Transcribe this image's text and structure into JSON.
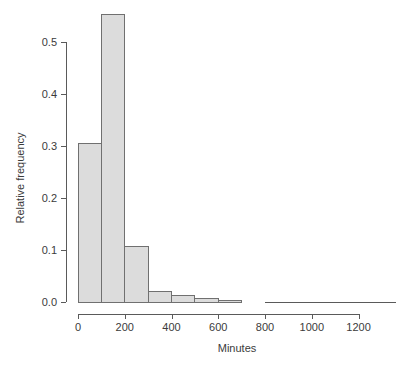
{
  "chart_data": {
    "type": "bar",
    "title": "",
    "subtitle": "",
    "xlabel": "Minutes",
    "ylabel": "Relative frequency",
    "xlim": [
      0,
      1300
    ],
    "ylim": [
      0.0,
      0.56
    ],
    "grid": false,
    "legend": "none",
    "bin_width": 100,
    "bin_edges": [
      0,
      100,
      200,
      300,
      400,
      500,
      600,
      700
    ],
    "categories": [
      "0-100",
      "100-200",
      "200-300",
      "300-400",
      "400-500",
      "500-600",
      "600-700"
    ],
    "values": [
      0.305,
      0.552,
      0.107,
      0.021,
      0.012,
      0.006,
      0.003
    ],
    "xticks": [
      0,
      200,
      400,
      600,
      800,
      1000,
      1200
    ],
    "xtick_labels": [
      "0",
      "200",
      "400",
      "600",
      "800",
      "1000",
      "1200"
    ],
    "yticks": [
      0.0,
      0.1,
      0.2,
      0.3,
      0.4,
      0.5
    ],
    "ytick_labels": [
      "0.0",
      "0.1",
      "0.2",
      "0.3",
      "0.4",
      "0.5"
    ],
    "bar_fill": "#dcdcdc",
    "bar_stroke": "#707070",
    "axis_color": "#5a5a5a",
    "text_color": "#3b3b3b",
    "background": "#ffffff"
  },
  "plot_geometry": {
    "left": 78,
    "right": 396,
    "top": 14,
    "bottom": 302,
    "x_axis_y": 314,
    "y_axis_x": 66,
    "y_axis_top": 43,
    "tick_len": 5,
    "x_per_minute": 0.2338,
    "y_per_unit": 520
  }
}
